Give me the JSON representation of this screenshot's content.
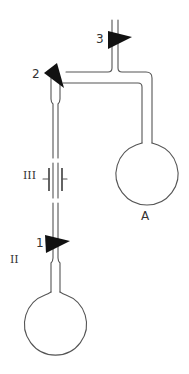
{
  "diagram": {
    "title": "",
    "labels": {
      "valve_1": "1",
      "valve_2": "2",
      "valve_3": "3",
      "flask_a": "A",
      "section_ii": "II",
      "section_iii": "III"
    },
    "components": [
      {
        "id": "valve-3",
        "type": "stopcock",
        "label": "3",
        "location": "top inlet tube"
      },
      {
        "id": "valve-2",
        "type": "stopcock",
        "label": "2",
        "location": "junction above left column"
      },
      {
        "id": "valve-1",
        "type": "stopcock",
        "label": "1",
        "location": "above lower flask"
      },
      {
        "id": "flask-a",
        "type": "round-bottom flask",
        "label": "A",
        "location": "right"
      },
      {
        "id": "flask-ii",
        "type": "round-bottom flask",
        "label": "II",
        "location": "bottom left"
      },
      {
        "id": "electrodes-iii",
        "type": "capacitor/electrode plates",
        "label": "III",
        "location": "middle of left column"
      }
    ],
    "colors": {
      "line": "#555555",
      "valve_fill": "#111111",
      "background": "#ffffff"
    }
  }
}
